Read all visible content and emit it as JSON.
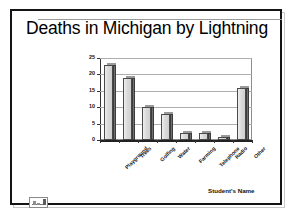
{
  "slide": {
    "title": "Deaths in Michigan by Lightning",
    "student_name": "Student's Name",
    "corner_thumbnail_icon": "chart-thumbnail-icon"
  },
  "chart_data": {
    "type": "bar",
    "title": "Deaths in Michigan by Lightning",
    "xlabel": "",
    "ylabel": "",
    "categories": [
      "Playground",
      "Trees",
      "Golfing",
      "Water",
      "Farming",
      "Telephone",
      "Radio",
      "Other"
    ],
    "values": [
      23,
      19,
      10,
      8,
      2,
      2,
      1,
      16
    ],
    "ylim": [
      0,
      25
    ],
    "yticks": [
      0,
      5,
      10,
      15,
      20,
      25
    ],
    "ytick_labels": [
      "0",
      "5",
      "10",
      "15",
      "20",
      "25"
    ],
    "grid": true,
    "legend": false,
    "legend_position": "none",
    "series": [
      {
        "name": "Deaths",
        "values": [
          23,
          19,
          10,
          8,
          2,
          2,
          1,
          16
        ]
      }
    ],
    "style": {
      "bar_fill": "#dcdcdc",
      "bar_edge": "#4a4a4a",
      "bar_side_3d": "#6f6f6f",
      "gridline_color": "#aeaeae",
      "plot_border": "#8d8d8d",
      "axis_color": "#222222",
      "text_color": "#000000",
      "background": "#ffffff"
    }
  }
}
